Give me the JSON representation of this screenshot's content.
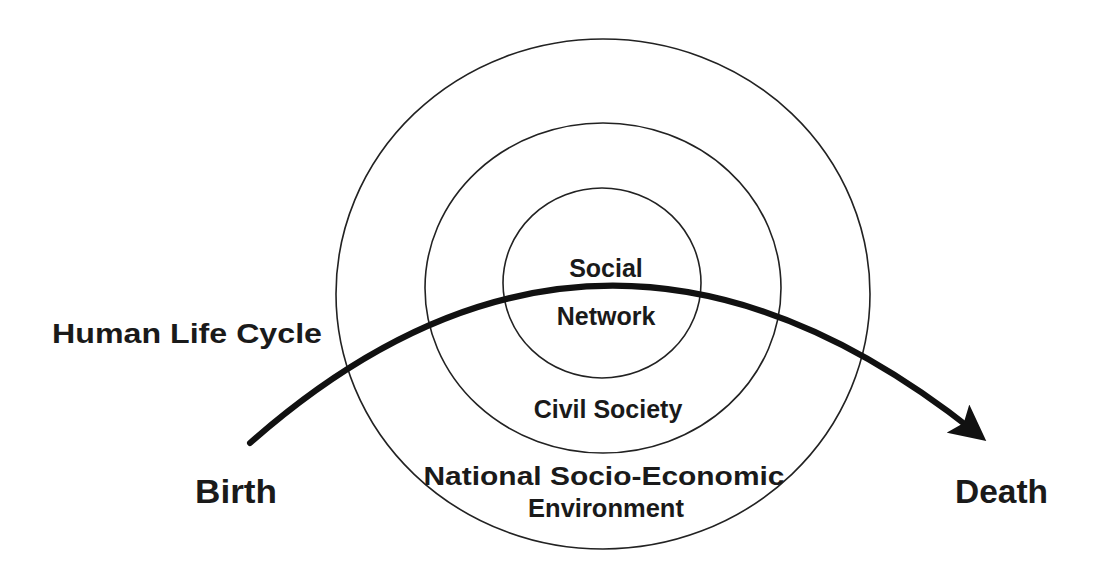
{
  "diagram": {
    "colors": {
      "background": "#ffffff",
      "stroke": "#222222",
      "text": "#1a1a1a"
    },
    "rings": [
      {
        "id": "outer",
        "label_lines": [
          "National Socio-Economic",
          "Environment"
        ]
      },
      {
        "id": "middle",
        "label_lines": [
          "Civil Society"
        ]
      },
      {
        "id": "inner",
        "label_lines": [
          "Social",
          "Network"
        ]
      }
    ],
    "life_cycle": {
      "title": "Human Life Cycle",
      "start_label": "Birth",
      "end_label": "Death"
    }
  }
}
